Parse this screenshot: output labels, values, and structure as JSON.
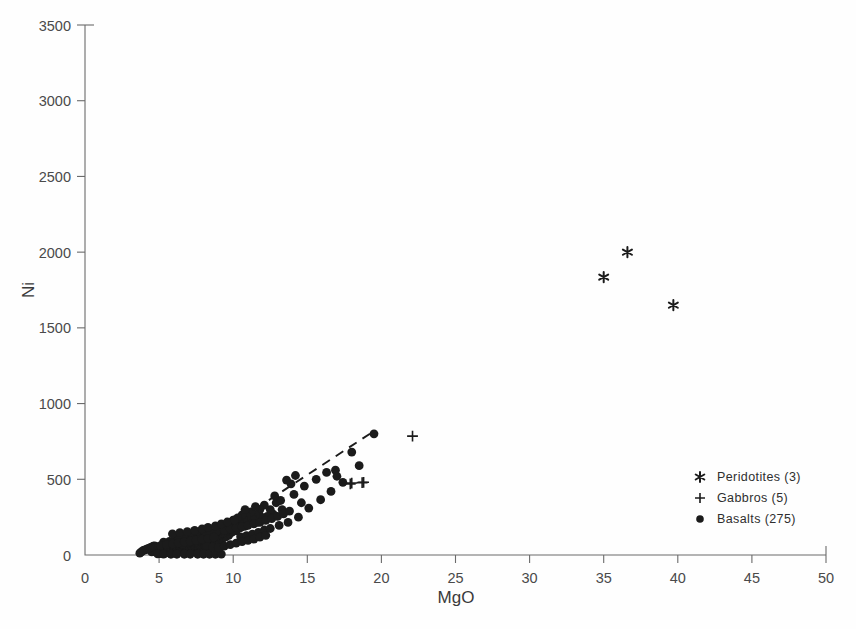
{
  "chart_data": {
    "type": "scatter",
    "title": "",
    "xlabel": "MgO",
    "ylabel": "Ni",
    "xlim": [
      0,
      50
    ],
    "ylim": [
      0,
      3500
    ],
    "xticks": [
      0,
      5,
      10,
      15,
      20,
      25,
      30,
      35,
      40,
      45,
      50
    ],
    "yticks": [
      0,
      500,
      1000,
      1500,
      2000,
      2500,
      3000,
      3500
    ],
    "grid": false,
    "legend_position": "lower-right",
    "marker_color": "#1b1b1b",
    "axis_color": "#6b6b6b",
    "trendline": {
      "style": "dashed",
      "x_start": 8.8,
      "y_start": 130,
      "x_end": 19.6,
      "y_end": 825
    },
    "series": [
      {
        "name": "Peridotites (3)",
        "label": "Peridotites",
        "count": 3,
        "marker": "asterisk",
        "points": [
          [
            35.0,
            1835
          ],
          [
            36.6,
            2000
          ],
          [
            39.7,
            1650
          ]
        ]
      },
      {
        "name": "Gabbros (5)",
        "label": "Gabbros",
        "count": 5,
        "marker": "plus",
        "points": [
          [
            22.1,
            785
          ],
          [
            18.0,
            475
          ],
          [
            18.8,
            480
          ],
          [
            17.9,
            470
          ],
          [
            18.7,
            478
          ]
        ]
      },
      {
        "name": "Basalts (275)",
        "label": "Basalts",
        "count": 275,
        "marker": "circle",
        "points": [
          [
            19.5,
            800
          ],
          [
            18.0,
            680
          ],
          [
            16.9,
            560
          ],
          [
            16.3,
            545
          ],
          [
            15.6,
            500
          ],
          [
            14.8,
            455
          ],
          [
            14.2,
            525
          ],
          [
            14.1,
            400
          ],
          [
            13.9,
            470
          ],
          [
            13.6,
            495
          ],
          [
            13.3,
            300
          ],
          [
            12.9,
            345
          ],
          [
            12.7,
            270
          ],
          [
            12.5,
            300
          ],
          [
            12.3,
            255
          ],
          [
            12.1,
            330
          ],
          [
            11.9,
            250
          ],
          [
            11.8,
            300
          ],
          [
            11.6,
            215
          ],
          [
            11.5,
            265
          ],
          [
            11.3,
            240
          ],
          [
            11.2,
            285
          ],
          [
            11.0,
            210
          ],
          [
            10.9,
            255
          ],
          [
            10.8,
            190
          ],
          [
            10.7,
            235
          ],
          [
            10.6,
            265
          ],
          [
            10.5,
            180
          ],
          [
            10.4,
            215
          ],
          [
            10.3,
            245
          ],
          [
            10.2,
            160
          ],
          [
            10.1,
            200
          ],
          [
            10.0,
            230
          ],
          [
            9.9,
            150
          ],
          [
            9.9,
            185
          ],
          [
            9.8,
            215
          ],
          [
            9.7,
            130
          ],
          [
            9.7,
            170
          ],
          [
            9.6,
            200
          ],
          [
            9.5,
            120
          ],
          [
            9.5,
            155
          ],
          [
            9.4,
            185
          ],
          [
            9.3,
            110
          ],
          [
            9.3,
            145
          ],
          [
            9.2,
            175
          ],
          [
            9.1,
            100
          ],
          [
            9.1,
            135
          ],
          [
            9.0,
            165
          ],
          [
            9.0,
            90
          ],
          [
            8.9,
            125
          ],
          [
            8.9,
            155
          ],
          [
            8.8,
            85
          ],
          [
            8.8,
            115
          ],
          [
            8.7,
            145
          ],
          [
            8.7,
            75
          ],
          [
            8.6,
            105
          ],
          [
            8.6,
            135
          ],
          [
            8.5,
            70
          ],
          [
            8.5,
            100
          ],
          [
            8.5,
            128
          ],
          [
            8.4,
            62
          ],
          [
            8.4,
            95
          ],
          [
            8.4,
            120
          ],
          [
            8.3,
            58
          ],
          [
            8.3,
            88
          ],
          [
            8.3,
            115
          ],
          [
            8.2,
            54
          ],
          [
            8.2,
            82
          ],
          [
            8.2,
            110
          ],
          [
            8.1,
            50
          ],
          [
            8.1,
            78
          ],
          [
            8.1,
            105
          ],
          [
            8.0,
            46
          ],
          [
            8.0,
            74
          ],
          [
            8.0,
            100
          ],
          [
            7.9,
            44
          ],
          [
            7.9,
            70
          ],
          [
            7.9,
            96
          ],
          [
            7.8,
            42
          ],
          [
            7.8,
            68
          ],
          [
            7.8,
            92
          ],
          [
            7.7,
            40
          ],
          [
            7.7,
            65
          ],
          [
            7.7,
            90
          ],
          [
            7.6,
            38
          ],
          [
            7.6,
            62
          ],
          [
            7.6,
            88
          ],
          [
            7.5,
            36
          ],
          [
            7.5,
            60
          ],
          [
            7.5,
            85
          ],
          [
            7.4,
            34
          ],
          [
            7.4,
            58
          ],
          [
            7.4,
            82
          ],
          [
            7.3,
            33
          ],
          [
            7.3,
            56
          ],
          [
            7.3,
            80
          ],
          [
            7.2,
            32
          ],
          [
            7.2,
            54
          ],
          [
            7.2,
            78
          ],
          [
            7.1,
            31
          ],
          [
            7.1,
            52
          ],
          [
            7.1,
            76
          ],
          [
            7.0,
            30
          ],
          [
            7.0,
            50
          ],
          [
            7.0,
            74
          ],
          [
            6.9,
            29
          ],
          [
            6.9,
            48
          ],
          [
            6.9,
            72
          ],
          [
            6.8,
            28
          ],
          [
            6.8,
            47
          ],
          [
            6.8,
            70
          ],
          [
            6.7,
            27
          ],
          [
            6.7,
            46
          ],
          [
            6.7,
            68
          ],
          [
            6.6,
            26
          ],
          [
            6.6,
            45
          ],
          [
            6.6,
            66
          ],
          [
            6.5,
            25
          ],
          [
            6.5,
            44
          ],
          [
            6.5,
            64
          ],
          [
            6.4,
            24
          ],
          [
            6.4,
            43
          ],
          [
            6.4,
            62
          ],
          [
            6.3,
            23
          ],
          [
            6.3,
            42
          ],
          [
            6.3,
            60
          ],
          [
            6.2,
            22
          ],
          [
            6.2,
            41
          ],
          [
            6.2,
            58
          ],
          [
            6.1,
            21
          ],
          [
            6.1,
            40
          ],
          [
            6.1,
            56
          ],
          [
            6.0,
            20
          ],
          [
            6.0,
            39
          ],
          [
            6.0,
            54
          ],
          [
            5.9,
            19
          ],
          [
            5.9,
            38
          ],
          [
            5.9,
            52
          ],
          [
            5.8,
            18
          ],
          [
            5.8,
            37
          ],
          [
            5.8,
            50
          ],
          [
            5.7,
            17
          ],
          [
            5.7,
            36
          ],
          [
            5.7,
            48
          ],
          [
            5.6,
            16
          ],
          [
            5.6,
            35
          ],
          [
            5.6,
            46
          ],
          [
            5.5,
            15
          ],
          [
            5.5,
            34
          ],
          [
            5.5,
            44
          ],
          [
            5.4,
            14
          ],
          [
            5.4,
            33
          ],
          [
            5.4,
            42
          ],
          [
            5.3,
            13
          ],
          [
            5.3,
            32
          ],
          [
            5.3,
            40
          ],
          [
            5.2,
            12
          ],
          [
            5.2,
            31
          ],
          [
            5.2,
            38
          ],
          [
            5.1,
            11
          ],
          [
            5.1,
            30
          ],
          [
            5.1,
            36
          ],
          [
            5.0,
            10
          ],
          [
            5.0,
            29
          ],
          [
            5.0,
            34
          ],
          [
            4.9,
            28
          ],
          [
            4.9,
            45
          ],
          [
            4.8,
            26
          ],
          [
            4.8,
            55
          ],
          [
            4.7,
            24
          ],
          [
            4.7,
            60
          ],
          [
            4.6,
            22
          ],
          [
            4.6,
            58
          ],
          [
            4.5,
            20
          ],
          [
            4.5,
            52
          ],
          [
            4.4,
            48
          ],
          [
            4.3,
            44
          ],
          [
            4.2,
            40
          ],
          [
            4.1,
            36
          ],
          [
            4.0,
            32
          ],
          [
            3.9,
            28
          ],
          [
            3.8,
            20
          ],
          [
            3.7,
            12
          ],
          [
            4.9,
            8
          ],
          [
            5.3,
            6
          ],
          [
            5.8,
            5
          ],
          [
            6.2,
            5
          ],
          [
            6.7,
            5
          ],
          [
            7.1,
            5
          ],
          [
            7.6,
            5
          ],
          [
            8.0,
            5
          ],
          [
            8.4,
            5
          ],
          [
            8.8,
            5
          ],
          [
            9.2,
            6
          ],
          [
            6.5,
            100
          ],
          [
            6.9,
            105
          ],
          [
            7.3,
            110
          ],
          [
            7.7,
            115
          ],
          [
            6.1,
            95
          ],
          [
            5.7,
            90
          ],
          [
            5.3,
            85
          ],
          [
            6.3,
            125
          ],
          [
            6.8,
            130
          ],
          [
            7.2,
            135
          ],
          [
            7.6,
            140
          ],
          [
            8.1,
            145
          ],
          [
            8.5,
            150
          ],
          [
            8.9,
            158
          ],
          [
            9.4,
            165
          ],
          [
            9.8,
            172
          ],
          [
            10.2,
            180
          ],
          [
            10.6,
            188
          ],
          [
            11.0,
            196
          ],
          [
            11.4,
            205
          ],
          [
            11.8,
            215
          ],
          [
            12.2,
            228
          ],
          [
            12.6,
            240
          ],
          [
            13.0,
            255
          ],
          [
            13.4,
            272
          ],
          [
            13.8,
            290
          ],
          [
            5.9,
            140
          ],
          [
            6.4,
            148
          ],
          [
            6.9,
            155
          ],
          [
            7.4,
            163
          ],
          [
            7.9,
            172
          ],
          [
            8.3,
            182
          ],
          [
            8.8,
            192
          ],
          [
            9.2,
            205
          ],
          [
            9.6,
            218
          ],
          [
            10.1,
            232
          ],
          [
            10.5,
            120
          ],
          [
            10.9,
            128
          ],
          [
            11.3,
            138
          ],
          [
            11.7,
            150
          ],
          [
            12.1,
            165
          ],
          [
            6.6,
            72
          ],
          [
            7.0,
            85
          ],
          [
            7.4,
            98
          ],
          [
            7.8,
            108
          ],
          [
            8.2,
            62
          ],
          [
            8.6,
            52
          ],
          [
            9.0,
            48
          ],
          [
            9.4,
            58
          ],
          [
            9.8,
            68
          ],
          [
            10.2,
            78
          ],
          [
            10.6,
            88
          ],
          [
            11.0,
            96
          ],
          [
            11.4,
            105
          ],
          [
            11.8,
            118
          ],
          [
            12.2,
            130
          ],
          [
            5.1,
            62
          ],
          [
            5.5,
            68
          ],
          [
            5.9,
            74
          ],
          [
            6.3,
            80
          ],
          [
            6.7,
            86
          ],
          [
            7.1,
            92
          ],
          [
            7.5,
            98
          ],
          [
            7.9,
            104
          ],
          [
            8.3,
            110
          ],
          [
            8.7,
            118
          ],
          [
            12.5,
            175
          ],
          [
            13.1,
            195
          ],
          [
            13.7,
            215
          ],
          [
            14.4,
            250
          ],
          [
            15.1,
            310
          ],
          [
            15.9,
            365
          ],
          [
            16.6,
            420
          ],
          [
            17.4,
            480
          ],
          [
            18.5,
            590
          ],
          [
            17.0,
            520
          ],
          [
            14.6,
            345
          ],
          [
            13.2,
            360
          ],
          [
            12.8,
            390
          ],
          [
            11.5,
            320
          ],
          [
            10.8,
            300
          ]
        ]
      }
    ]
  },
  "axis": {
    "ylabel_text": "Ni",
    "xlabel_text": "MgO"
  },
  "legend": {
    "entries": [
      {
        "marker": "asterisk",
        "label": "Peridotites  (3)"
      },
      {
        "marker": "plus",
        "label": "Gabbros  (5)"
      },
      {
        "marker": "circle",
        "label": "Basalts  (275)"
      }
    ]
  }
}
